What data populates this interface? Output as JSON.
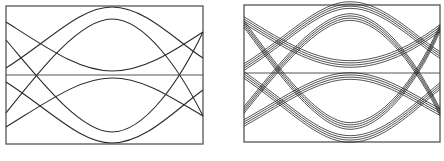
{
  "figure": {
    "stroke_color": "#2a2a2a",
    "frame_color": "#555555",
    "panels": [
      {
        "name": "single-trace-eye",
        "box": {
          "x": 6,
          "y": 6,
          "w": 197,
          "h": 138
        },
        "midline_y": 75,
        "bundle_count": 1,
        "curves": [
          "M6,68 C50,40 80,7 112,7 C145,7 175,40 203,58",
          "M6,22 C50,50 80,71 112,71 C145,71 175,50 203,32",
          "M6,82 C50,110 80,143 112,143 C145,143 175,110 203,90",
          "M6,127 C50,100 80,78 112,78 C145,78 175,100 203,116",
          "M6,113 C40,70 80,19 112,19 C145,19 180,70 203,116",
          "M6,40 C40,80 80,132 112,132 C145,132 180,80 203,32"
        ]
      },
      {
        "name": "multi-trace-eye",
        "box": {
          "x": 244,
          "y": 5,
          "w": 196,
          "h": 137
        },
        "midline_y": 73,
        "bundle_count": 4,
        "bundle_spacing": 2.2,
        "curves": [
          "M244,67 C288,40 318,5 350,5 C383,5 413,38 440,55",
          "M244,20 C288,48 318,64 350,64 C383,64 413,48 440,28",
          "M244,75 C288,105 318,139 350,139 C383,139 413,108 440,86",
          "M244,123 C288,98 318,76 350,76 C383,76 413,98 440,112",
          "M244,110 C278,68 318,17 350,17 C383,17 418,68 440,112",
          "M244,24 C278,70 318,126 350,126 C383,126 418,78 440,28"
        ]
      }
    ]
  }
}
